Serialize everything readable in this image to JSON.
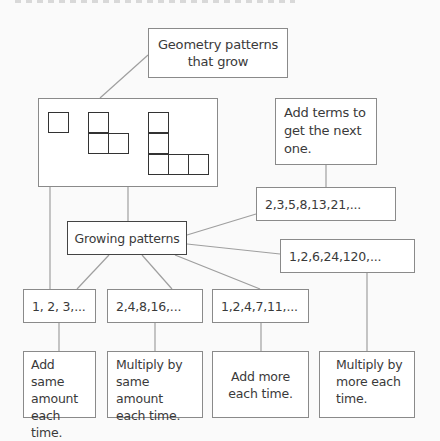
{
  "diagram": {
    "geometry_box": {
      "label": "Geometry patterns\nthat grow"
    },
    "add_terms_box": {
      "label": "Add terms to\nget the next\none."
    },
    "fibonacci_box": {
      "label": "2,3,5,8,13,21,..."
    },
    "root_box": {
      "label": "Growing patterns"
    },
    "factorial_box": {
      "label": "1,2,6,24,120,..."
    },
    "sequences": [
      {
        "label": "1, 2, 3,..."
      },
      {
        "label": "2,4,8,16,..."
      },
      {
        "label": "1,2,4,7,11,..."
      }
    ],
    "rules": [
      {
        "label": "Add same\namount\neach time."
      },
      {
        "label": "Multiply by\nsame amount\neach time."
      },
      {
        "label": "Add more\neach time."
      },
      {
        "label": "Multiply by\nmore each\ntime."
      }
    ],
    "colors": {
      "line": "#9a9a9a",
      "box_border": "#8a8a8a",
      "root_border": "#444444",
      "text": "#3a3a3a"
    }
  }
}
